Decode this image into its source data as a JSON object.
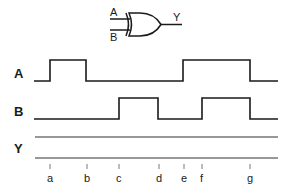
{
  "gate": {
    "type": "XOR",
    "input_a_label": "A",
    "input_b_label": "B",
    "output_label": "Y"
  },
  "timing_diagram": {
    "signals": [
      {
        "name": "A",
        "label": "A",
        "transitions": [
          "low",
          "rise@a",
          "fall@b",
          "rise@e",
          "fall@g"
        ]
      },
      {
        "name": "B",
        "label": "B",
        "transitions": [
          "low",
          "rise@c",
          "fall@d",
          "rise@f",
          "fall@g"
        ]
      },
      {
        "name": "Y",
        "label": "Y",
        "transitions": []
      }
    ],
    "time_markers": [
      "a",
      "b",
      "c",
      "d",
      "e",
      "f",
      "g"
    ]
  }
}
